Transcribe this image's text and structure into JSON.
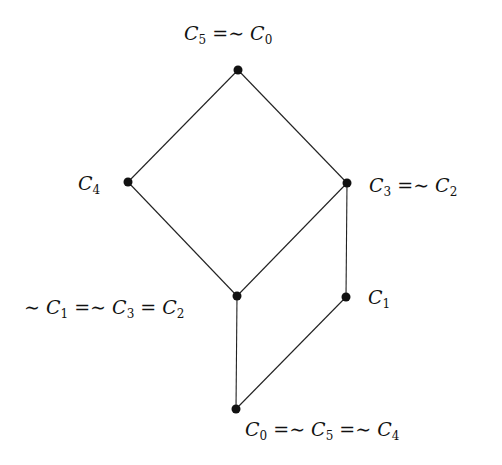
{
  "diagram": {
    "type": "hasse-diagram",
    "background": "#ffffff",
    "stroke_color": "#222222",
    "node_color": "#111111",
    "nodes": [
      {
        "id": "top",
        "x": 238,
        "y": 70,
        "label": "C5 =∼ C0",
        "label_parts": [
          {
            "b": "C",
            "s": "5"
          },
          {
            "op": " =∼ "
          },
          {
            "b": "C",
            "s": "0"
          }
        ],
        "label_pos": {
          "x": 184,
          "y": 24
        }
      },
      {
        "id": "c4",
        "x": 128,
        "y": 182,
        "label": "C4",
        "label_parts": [
          {
            "b": "C",
            "s": "4"
          }
        ],
        "label_pos": {
          "x": 78,
          "y": 174
        }
      },
      {
        "id": "c3",
        "x": 347,
        "y": 183,
        "label": "C3 =∼ C2",
        "label_parts": [
          {
            "b": "C",
            "s": "3"
          },
          {
            "op": " =∼ "
          },
          {
            "b": "C",
            "s": "2"
          }
        ],
        "label_pos": {
          "x": 369,
          "y": 176
        }
      },
      {
        "id": "mid",
        "x": 237,
        "y": 296,
        "label": "∼ C1 =∼ C3 = C2",
        "label_parts": [
          {
            "op": "∼ "
          },
          {
            "b": "C",
            "s": "1"
          },
          {
            "op": " =∼ "
          },
          {
            "b": "C",
            "s": "3"
          },
          {
            "op": " = "
          },
          {
            "b": "C",
            "s": "2"
          }
        ],
        "label_pos": {
          "x": 24,
          "y": 298
        }
      },
      {
        "id": "c1",
        "x": 346,
        "y": 297,
        "label": "C1",
        "label_parts": [
          {
            "b": "C",
            "s": "1"
          }
        ],
        "label_pos": {
          "x": 368,
          "y": 288
        }
      },
      {
        "id": "bottom",
        "x": 236,
        "y": 409,
        "label": "C0 =∼ C5 =∼ C4",
        "label_parts": [
          {
            "b": "C",
            "s": "0"
          },
          {
            "op": " =∼ "
          },
          {
            "b": "C",
            "s": "5"
          },
          {
            "op": " =∼ "
          },
          {
            "b": "C",
            "s": "4"
          }
        ],
        "label_pos": {
          "x": 245,
          "y": 420
        }
      }
    ],
    "edges": [
      [
        "top",
        "c4"
      ],
      [
        "top",
        "c3"
      ],
      [
        "c4",
        "mid"
      ],
      [
        "c3",
        "mid"
      ],
      [
        "c3",
        "c1"
      ],
      [
        "mid",
        "bottom"
      ],
      [
        "c1",
        "bottom"
      ]
    ]
  }
}
